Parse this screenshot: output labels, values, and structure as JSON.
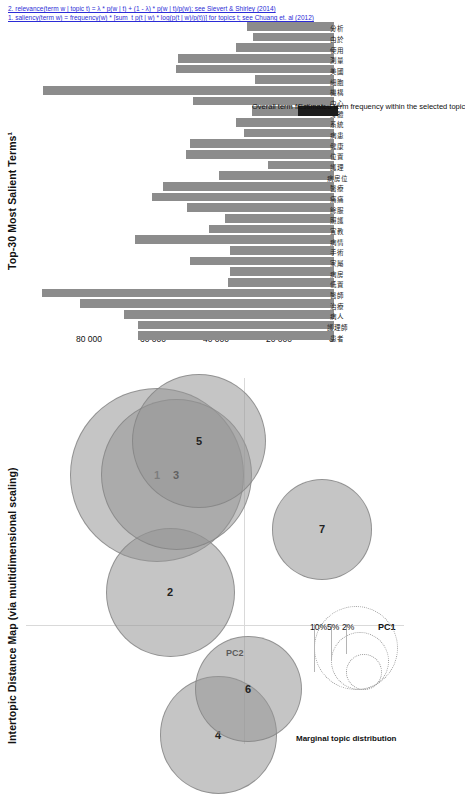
{
  "figure": {
    "kind": "ldavis-topic-model",
    "rotation_deg": -90,
    "bar_color": "#8c8c8c",
    "bubble_color": "#969696",
    "accent_link": "#2b2bd6"
  },
  "map": {
    "title": "Intertopic Distance Map (via multidimensional scaling)",
    "x_axis_label": "PC1",
    "y_axis_label": "PC2",
    "topics": [
      {
        "id": "1",
        "x": 0.58,
        "y": 0.72,
        "r": 0.155
      },
      {
        "id": "2",
        "x": 0.49,
        "y": 0.16,
        "r": 0.115
      },
      {
        "id": "3",
        "x": 0.45,
        "y": 0.72,
        "r": 0.135
      },
      {
        "id": "4",
        "x": 0.17,
        "y": -0.52,
        "r": 0.105
      },
      {
        "id": "5",
        "x": 0.3,
        "y": 0.88,
        "r": 0.12
      },
      {
        "id": "6",
        "x": -0.03,
        "y": -0.3,
        "r": 0.095
      },
      {
        "id": "7",
        "x": -0.52,
        "y": 0.46,
        "r": 0.09
      }
    ],
    "marginal_legend": {
      "title": "Marginal topic distribution",
      "rings": [
        "2%",
        "5%",
        "10%"
      ]
    }
  },
  "bars": {
    "title": "Top-30 Most Salient Terms¹",
    "y_ticks": [
      "0",
      "20 000",
      "40 000",
      "60 000",
      "80 000"
    ],
    "y_max": 95000,
    "legend": [
      {
        "swatch": "overall",
        "label": "Overall term frequency"
      },
      {
        "swatch": "estimated",
        "label": "Estimated term frequency within the selected topic"
      }
    ],
    "footnotes": [
      "1. saliency(term w) = frequency(w) * [sum_t p(t | w) * log(p(t | w)/p(t))] for topics t; see Chuang et. al (2012)",
      "2. relevance(term w | topic t) = λ * p(w | t) + (1 - λ) * p(w | t)/p(w); see Sievert & Shirley (2014)"
    ]
  },
  "chart_data": {
    "type": "bar",
    "title": "Top-30 Most Salient Terms¹",
    "xlabel": "",
    "ylabel": "",
    "ylim": [
      0,
      95000
    ],
    "grid": false,
    "legend_position": "right",
    "categories": [
      "患者",
      "護理師",
      "病人",
      "治療",
      "醫師",
      "低置",
      "病房",
      "家屬",
      "手術",
      "病情",
      "宣教",
      "照護",
      "餘服",
      "痛痛",
      "醫療",
      "病房位",
      "護理",
      "位置",
      "健康",
      "病患",
      "系統",
      "身體",
      "中心",
      "機構",
      "細胞",
      "美國",
      "測量",
      "使用",
      "由於",
      "分析"
    ],
    "values": [
      62000,
      62200,
      66500,
      80500,
      92500,
      33500,
      33000,
      45500,
      33000,
      63000,
      39500,
      34500,
      46500,
      57500,
      54000,
      36500,
      21000,
      47000,
      45500,
      28500,
      31000,
      20500,
      44500,
      92000,
      25000,
      50000,
      49500,
      31000,
      25500,
      27500
    ],
    "series": [
      {
        "name": "Overall term frequency",
        "values": [
          62000,
          62200,
          66500,
          80500,
          92500,
          33500,
          33000,
          45500,
          33000,
          63000,
          39500,
          34500,
          46500,
          57500,
          54000,
          36500,
          21000,
          47000,
          45500,
          28500,
          31000,
          20500,
          44500,
          92000,
          25000,
          50000,
          49500,
          31000,
          25500,
          27500
        ]
      }
    ]
  }
}
